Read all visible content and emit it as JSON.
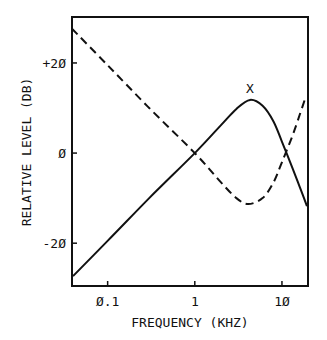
{
  "chart_data": {
    "type": "line",
    "title": "",
    "xlabel": "FREQUENCY (KHZ)",
    "ylabel": "RELATIVE LEVEL (DB)",
    "xscale": "log",
    "xlim": [
      0.039,
      19.9
    ],
    "ylim": [
      -29.5,
      30.2
    ],
    "x_ticks": [
      {
        "value": 0.1,
        "label": "Ø.1"
      },
      {
        "value": 1,
        "label": "1"
      },
      {
        "value": 10,
        "label": "1Ø"
      }
    ],
    "y_ticks": [
      {
        "value": 20,
        "label": "+2Ø"
      },
      {
        "value": 0,
        "label": "Ø"
      },
      {
        "value": -20,
        "label": "-2Ø"
      }
    ],
    "grid": false,
    "legend": null,
    "annotations": [
      {
        "text": "X",
        "x": 4.3,
        "y": 14.5
      }
    ],
    "series": [
      {
        "name": "solid",
        "style": "solid",
        "x": [
          0.04,
          0.1,
          0.3,
          1,
          2,
          3,
          4.3,
          6,
          8,
          10,
          13,
          16,
          19.4
        ],
        "y": [
          -27.3,
          -19.5,
          -10,
          0,
          6.2,
          9.8,
          11.8,
          10.5,
          7,
          2.5,
          -3,
          -7.5,
          -11.8
        ]
      },
      {
        "name": "dashed",
        "style": "dashed",
        "x": [
          0.039,
          0.1,
          0.3,
          1,
          2,
          3,
          4.1,
          6,
          8,
          10,
          13,
          16,
          18.4
        ],
        "y": [
          27.6,
          19.5,
          10,
          0,
          -6.5,
          -10,
          -11.3,
          -10,
          -6.5,
          -2,
          3.5,
          8.5,
          12
        ]
      }
    ]
  }
}
